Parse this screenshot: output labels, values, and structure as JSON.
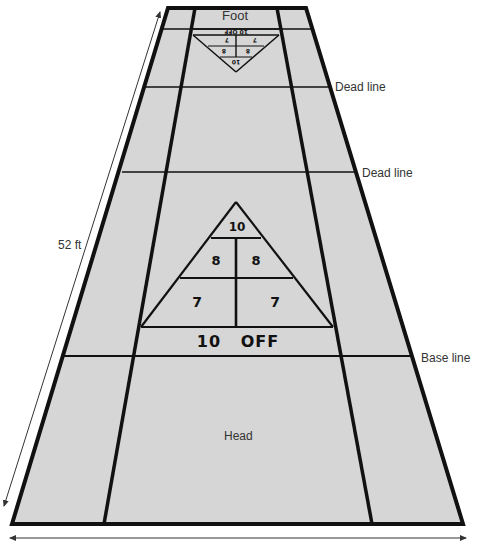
{
  "diagram": {
    "colors": {
      "court_fill": "#d6d6d6",
      "line": "#111111",
      "text": "#333333",
      "background": "#ffffff"
    },
    "labels": {
      "foot": "Foot",
      "dead_line_1": "Dead line",
      "dead_line_2": "Dead line",
      "base_line": "Base line",
      "head": "Head",
      "length": "52 ft"
    },
    "head_scoring_triangle": {
      "apex": "10",
      "left_8": "8",
      "right_8": "8",
      "left_7": "7",
      "right_7": "7",
      "off_bar": "10   OFF"
    },
    "foot_scoring_triangle": {
      "apex": "10",
      "left_8": "8",
      "right_8": "8",
      "left_7": "7",
      "right_7": "7",
      "off_bar": "10 OFF",
      "orientation": "inverted"
    },
    "arrows": [
      {
        "name": "length-arrow",
        "direction": "bidirectional"
      },
      {
        "name": "width-arrow",
        "direction": "bidirectional"
      }
    ]
  }
}
